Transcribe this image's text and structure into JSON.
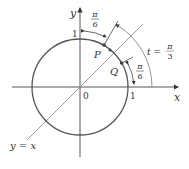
{
  "diagram": {
    "axes": {
      "x_label": "x",
      "y_label": "y",
      "origin_label": "0",
      "x_tick_label": "1",
      "y_tick_label": "1"
    },
    "line_label": "y = x",
    "points": {
      "P": "P",
      "Q": "Q"
    },
    "angles": {
      "top_pi": "π",
      "top_den": "6",
      "right_pi": "π",
      "right_den": "6",
      "t_label": "t =",
      "t_pi": "π",
      "t_den": "3"
    },
    "colors": {
      "circle": "#555555",
      "axes": "#444444",
      "line": "#888888",
      "text": "#333333"
    }
  }
}
